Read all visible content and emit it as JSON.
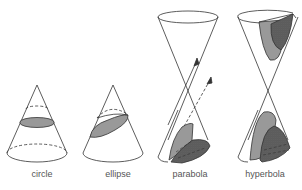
{
  "figure": {
    "colors": {
      "stroke": "#333333",
      "section_fill": "#999999",
      "cut_face_fill": "#e2e2e2",
      "background": "#ffffff"
    },
    "panels": [
      {
        "id": "circle",
        "label": "circle"
      },
      {
        "id": "ellipse",
        "label": "ellipse"
      },
      {
        "id": "parabola",
        "label": "parabola"
      },
      {
        "id": "hyperbola",
        "label": "hyperbola"
      }
    ]
  }
}
